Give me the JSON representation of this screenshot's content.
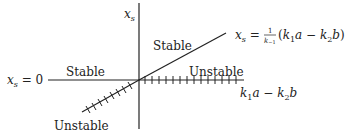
{
  "diagram": {
    "type": "bifurcation diagram",
    "vertical_axis_label": {
      "base": "x",
      "sub": "s"
    },
    "horizontal_axis_label": {
      "k1": "k",
      "k1_sub": "1",
      "a": "a",
      "minus": " − ",
      "k2": "k",
      "k2_sub": "2",
      "b": "b"
    },
    "left_branch_label": {
      "base": "x",
      "sub": "s",
      "eq": " = 0"
    },
    "diagonal_branch_label": {
      "base": "x",
      "sub": "s",
      "eq": " = ",
      "num": "1",
      "den_base": "k",
      "den_sub": "−1",
      "paren_open": "(",
      "k1": "k",
      "k1_sub": "1",
      "a": "a",
      "minus": " − ",
      "k2": "k",
      "k2_sub": "2",
      "b": "b",
      "paren_close": ")"
    },
    "regions": {
      "upper_diagonal": "Stable",
      "left_horizontal": "Stable",
      "right_horizontal": "Unstable",
      "lower_diagonal": "Unstable"
    },
    "colors": {
      "line": "#222222",
      "text": "#222222"
    }
  }
}
